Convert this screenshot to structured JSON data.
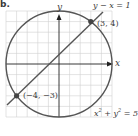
{
  "problem_label": "b.",
  "axes": {
    "x_label": "x",
    "y_label": "y"
  },
  "line": {
    "equation": "y − x = 1"
  },
  "circle": {
    "equation_lhs": "x",
    "equation_mid": " + y",
    "equation_rhs": " = 5"
  },
  "points": [
    {
      "label": "(3, 4)",
      "x": 3,
      "y": 4
    },
    {
      "label": "(−4, −3)",
      "x": -4,
      "y": -3
    }
  ],
  "colors": {
    "curve": "#555555",
    "grid": "#cfcfcf",
    "axis": "#222222"
  }
}
